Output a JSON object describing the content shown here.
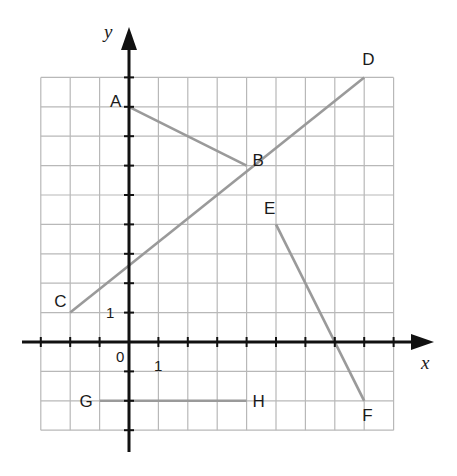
{
  "diagram": {
    "type": "coordinate-grid",
    "axes": {
      "x_label": "x",
      "y_label": "y",
      "origin_label": "0",
      "x_unit_label": "1",
      "y_unit_label": "1"
    },
    "grid": {
      "x_min": -3,
      "x_max": 9,
      "y_min": -3,
      "y_max": 9
    },
    "colors": {
      "grid": "#b8b8b8",
      "axis": "#111111",
      "segment": "#9a9a9a"
    },
    "points": [
      {
        "name": "A",
        "x": 0,
        "y": 8
      },
      {
        "name": "B",
        "x": 4,
        "y": 6
      },
      {
        "name": "C",
        "x": -2,
        "y": 1
      },
      {
        "name": "D",
        "x": 8,
        "y": 9
      },
      {
        "name": "E",
        "x": 5,
        "y": 4
      },
      {
        "name": "F",
        "x": 8,
        "y": -2
      },
      {
        "name": "G",
        "x": -1,
        "y": -2
      },
      {
        "name": "H",
        "x": 4,
        "y": -2
      }
    ],
    "segments": [
      {
        "name": "AB",
        "from": "A",
        "to": "B"
      },
      {
        "name": "CD",
        "from": "C",
        "to": "D"
      },
      {
        "name": "EF",
        "from": "E",
        "to": "F"
      },
      {
        "name": "GH",
        "from": "G",
        "to": "H"
      }
    ]
  }
}
